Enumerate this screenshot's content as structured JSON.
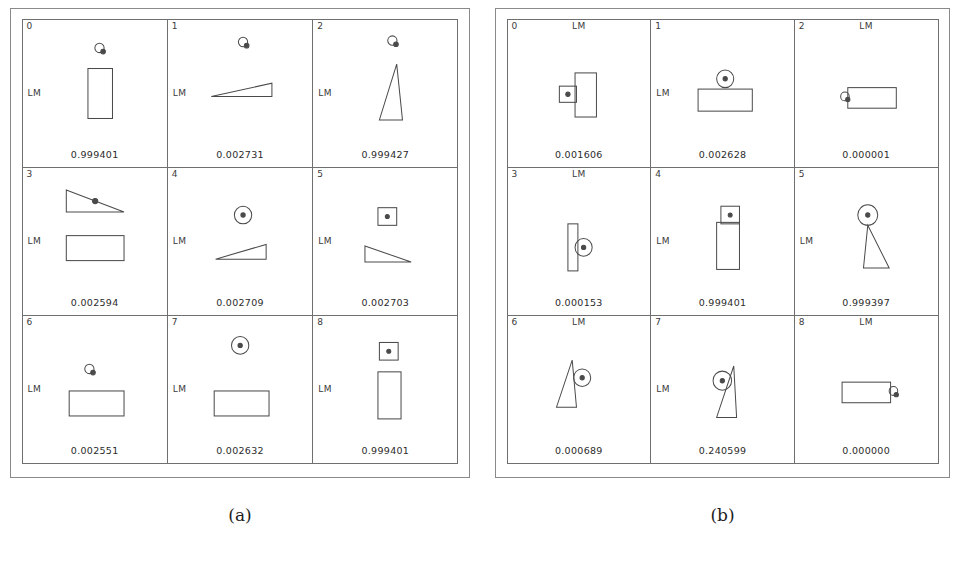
{
  "figures": [
    {
      "id": "a",
      "caption": "(a)",
      "panels": [
        {
          "index": "0",
          "lm_label": "LM",
          "lm_pos": "left",
          "score": "0.999401",
          "shapes": "marker-small over tall-rect"
        },
        {
          "index": "1",
          "lm_label": "LM",
          "lm_pos": "left",
          "score": "0.002731",
          "shapes": "marker-small over flat-triangle"
        },
        {
          "index": "2",
          "lm_label": "LM",
          "lm_pos": "left",
          "score": "0.999427",
          "shapes": "marker-small over narrow-triangle"
        },
        {
          "index": "3",
          "lm_label": "LM",
          "lm_pos": "left",
          "score": "0.002594",
          "shapes": "right-triangle with dot over wide-rect"
        },
        {
          "index": "4",
          "lm_label": "LM",
          "lm_pos": "left",
          "score": "0.002709",
          "shapes": "circle-dot over flat-triangle"
        },
        {
          "index": "5",
          "lm_label": "LM",
          "lm_pos": "left",
          "score": "0.002703",
          "shapes": "square-dot over flat-triangle"
        },
        {
          "index": "6",
          "lm_label": "LM",
          "lm_pos": "left",
          "score": "0.002551",
          "shapes": "marker-small over wide-rect"
        },
        {
          "index": "7",
          "lm_label": "LM",
          "lm_pos": "left",
          "score": "0.002632",
          "shapes": "circle-dot over wide-rect"
        },
        {
          "index": "8",
          "lm_label": "LM",
          "lm_pos": "left",
          "score": "0.999401",
          "shapes": "square-dot over tall-rect"
        }
      ]
    },
    {
      "id": "b",
      "caption": "(b)",
      "panels": [
        {
          "index": "0",
          "lm_label": "LM",
          "lm_pos": "top",
          "score": "0.001606",
          "shapes": "square-dot left of tall-rect"
        },
        {
          "index": "1",
          "lm_label": "LM",
          "lm_pos": "left",
          "score": "0.002628",
          "shapes": "circle-dot above wide-rect"
        },
        {
          "index": "2",
          "lm_label": "LM",
          "lm_pos": "top",
          "score": "0.000001",
          "shapes": "marker-small left of wide-rect"
        },
        {
          "index": "3",
          "lm_label": "LM",
          "lm_pos": "top",
          "score": "0.000153",
          "shapes": "circle-dot right of thin-bar"
        },
        {
          "index": "4",
          "lm_label": "LM",
          "lm_pos": "left",
          "score": "0.999401",
          "shapes": "square-dot above tall-rect"
        },
        {
          "index": "5",
          "lm_label": "LM",
          "lm_pos": "left",
          "score": "0.999397",
          "shapes": "circle-dot above triangle"
        },
        {
          "index": "6",
          "lm_label": "LM",
          "lm_pos": "top",
          "score": "0.000689",
          "shapes": "circle-dot right of narrow-triangle"
        },
        {
          "index": "7",
          "lm_label": "LM",
          "lm_pos": "left",
          "score": "0.240599",
          "shapes": "circle-dot left of narrow-triangle"
        },
        {
          "index": "8",
          "lm_label": "LM",
          "lm_pos": "top",
          "score": "0.000000",
          "shapes": "marker-small right of wide-rect"
        }
      ]
    }
  ],
  "colors": {
    "stroke": "#4a4a4a",
    "frame": "#8a8a8a",
    "panel_border": "#6f6f6f",
    "text": "#2b2b2b",
    "background": "#ffffff"
  }
}
